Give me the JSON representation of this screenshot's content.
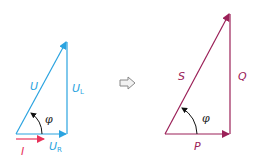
{
  "diagram": {
    "colors": {
      "voltage": "#2aa3e0",
      "current": "#e8335a",
      "power": "#9b2158",
      "angle_arrow": "#111111",
      "transition_arrow": "#888888"
    },
    "voltage_triangle": {
      "hypotenuse_label": "U",
      "vertical_label_main": "U",
      "vertical_label_sub": "L",
      "base_label_main": "U",
      "base_label_sub": "R",
      "current_label": "I",
      "angle_label": "φ"
    },
    "transition_icon": "right-arrow-icon",
    "power_triangle": {
      "hypotenuse_label": "S",
      "vertical_label": "Q",
      "base_label": "P",
      "angle_label": "φ"
    }
  }
}
